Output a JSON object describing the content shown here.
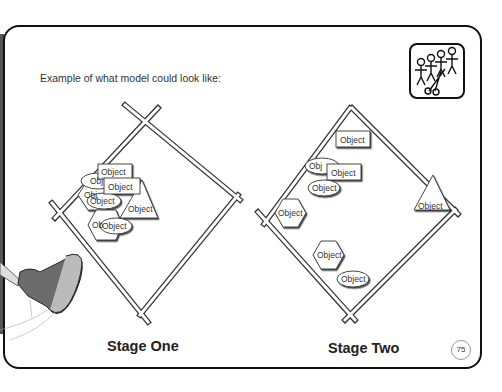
{
  "page": {
    "intro_text": "Example of what model could look like:",
    "page_number": "75",
    "icon": "paper-doll-chain-scissors-icon"
  },
  "stages": [
    {
      "label": "Stage One",
      "object_label": "Object",
      "objects": [
        {
          "shape": "rectangle",
          "label": "Object"
        },
        {
          "shape": "ellipse",
          "label": "Object"
        },
        {
          "shape": "rectangle",
          "label": "Object"
        },
        {
          "shape": "hexagon",
          "label": "Object"
        },
        {
          "shape": "ellipse",
          "label": "Object"
        },
        {
          "shape": "triangle",
          "label": "Object"
        },
        {
          "shape": "hexagon",
          "label": "Object"
        },
        {
          "shape": "ellipse",
          "label": "Object"
        }
      ]
    },
    {
      "label": "Stage Two",
      "object_label": "Object",
      "objects": [
        {
          "shape": "rectangle",
          "label": "Object"
        },
        {
          "shape": "ellipse",
          "label": "Object"
        },
        {
          "shape": "rectangle",
          "label": "Object"
        },
        {
          "shape": "ellipse",
          "label": "Object"
        },
        {
          "shape": "hexagon",
          "label": "Object"
        },
        {
          "shape": "triangle",
          "label": "Object"
        },
        {
          "shape": "hexagon",
          "label": "Object"
        },
        {
          "shape": "ellipse",
          "label": "Object"
        }
      ]
    }
  ]
}
